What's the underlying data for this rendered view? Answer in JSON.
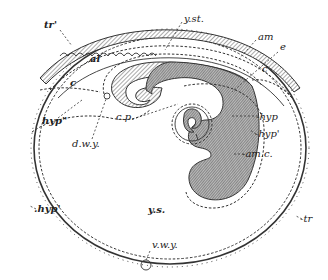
{
  "figure": {
    "labels": {
      "tr_prime": "tr'",
      "y_st": "y.st.",
      "am": "am",
      "e": "e",
      "al": "al",
      "c_left": "c",
      "c_right": "c",
      "hyp_double_prime": "hyp\"",
      "d_w_y": "d.w.y.",
      "c_p": "c.p.",
      "hyp": "-hyp",
      "hyp_prime_right": "-hyp'",
      "am_c": "-am.c.",
      "hyp_prime_left": ".hyp'",
      "y_s": "y.s.",
      "v_w_y": "v.w.y.",
      "tr": "-tr"
    }
  },
  "colors": {
    "ink": "#333333",
    "background": "#ffffff",
    "shade": "#888888"
  }
}
